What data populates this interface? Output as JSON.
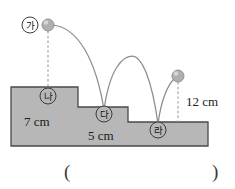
{
  "figure": {
    "colors": {
      "stair_fill": "#b7b7b7",
      "stair_stroke": "#4a4a4a",
      "ball_fill": "#b0b0b0",
      "ball_stroke": "#8a8a8a",
      "trajectory_stroke": "#8c8c8c",
      "dotted_stroke": "#9a9a9a",
      "text": "#1b1b1b"
    },
    "point_labels": [
      {
        "id": "ga",
        "text": "가",
        "x": 30,
        "y": 25
      },
      {
        "id": "na",
        "text": "나",
        "x": 48,
        "y": 96
      },
      {
        "id": "da",
        "text": "다",
        "x": 104,
        "y": 114
      },
      {
        "id": "ra",
        "text": "라",
        "x": 158,
        "y": 130
      }
    ],
    "dimensions": [
      {
        "id": "height-7cm",
        "text": "7 cm",
        "x": 24,
        "y": 126
      },
      {
        "id": "height-5cm",
        "text": "5 cm",
        "x": 88,
        "y": 140
      },
      {
        "id": "height-12cm",
        "text": "12 cm",
        "x": 186,
        "y": 106
      }
    ],
    "balls": [
      {
        "id": "ball-start",
        "cx": 48,
        "cy": 25,
        "r": 6
      },
      {
        "id": "ball-end",
        "cx": 178,
        "cy": 76,
        "r": 6
      }
    ],
    "answer_blank": {
      "open_paren": "(",
      "close_paren": ")"
    }
  }
}
